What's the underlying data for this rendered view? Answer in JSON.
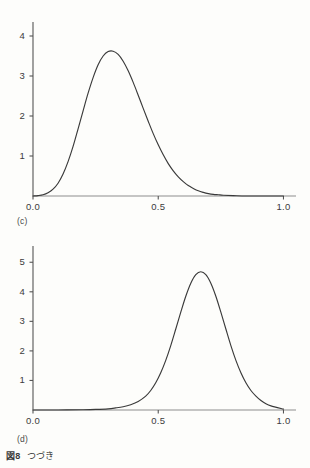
{
  "figure": {
    "caption_number": "図8",
    "caption_text": "つづき"
  },
  "panels": [
    {
      "id": "c",
      "label": "(c)"
    },
    {
      "id": "d",
      "label": "(d)"
    }
  ],
  "style": {
    "curve_color": "#3a3a3a",
    "axis_color": "#555555",
    "baseline_color": "#8e8e8e",
    "background": "#fdfdfb"
  },
  "chart_data": [
    {
      "type": "line",
      "panel": "(c)",
      "title": "",
      "xlabel": "",
      "ylabel": "",
      "xlim": [
        0.0,
        1.05
      ],
      "ylim": [
        0.0,
        4.35
      ],
      "grid": false,
      "legend": "none",
      "xticks": [
        0.0,
        0.5,
        1.0
      ],
      "xtick_labels": [
        "0.0",
        "0.5",
        "1.0"
      ],
      "yticks": [
        1,
        2,
        3,
        4
      ],
      "ytick_labels": [
        "1",
        "2",
        "3",
        "4"
      ],
      "peak": {
        "x": 0.32,
        "y": 3.62
      },
      "x": [
        0.0,
        0.02,
        0.04,
        0.06,
        0.08,
        0.1,
        0.12,
        0.14,
        0.16,
        0.18,
        0.2,
        0.22,
        0.24,
        0.26,
        0.28,
        0.3,
        0.32,
        0.34,
        0.36,
        0.38,
        0.4,
        0.42,
        0.44,
        0.46,
        0.48,
        0.5,
        0.52,
        0.54,
        0.56,
        0.58,
        0.6,
        0.62,
        0.64,
        0.66,
        0.68,
        0.7,
        0.72,
        0.74,
        0.76,
        0.8,
        0.85,
        0.9,
        0.95,
        1.0
      ],
      "y": [
        0.0,
        0.01,
        0.03,
        0.08,
        0.17,
        0.32,
        0.55,
        0.86,
        1.24,
        1.68,
        2.13,
        2.57,
        2.96,
        3.28,
        3.5,
        3.61,
        3.62,
        3.54,
        3.37,
        3.13,
        2.84,
        2.52,
        2.19,
        1.87,
        1.56,
        1.28,
        1.03,
        0.81,
        0.63,
        0.48,
        0.36,
        0.26,
        0.19,
        0.13,
        0.09,
        0.06,
        0.04,
        0.03,
        0.02,
        0.01,
        0.0,
        0.0,
        0.0,
        0.0
      ]
    },
    {
      "type": "line",
      "panel": "(d)",
      "title": "",
      "xlabel": "",
      "ylabel": "",
      "xlim": [
        0.0,
        1.05
      ],
      "ylim": [
        0.0,
        5.55
      ],
      "grid": false,
      "legend": "none",
      "xticks": [
        0.0,
        0.5,
        1.0
      ],
      "xtick_labels": [
        "0.0",
        "0.5",
        "1.0"
      ],
      "yticks": [
        1,
        2,
        3,
        4,
        5
      ],
      "ytick_labels": [
        "1",
        "2",
        "3",
        "4",
        "5"
      ],
      "peak": {
        "x": 0.67,
        "y": 4.68
      },
      "x": [
        0.0,
        0.1,
        0.2,
        0.25,
        0.3,
        0.33,
        0.36,
        0.39,
        0.42,
        0.45,
        0.47,
        0.49,
        0.51,
        0.53,
        0.55,
        0.57,
        0.59,
        0.61,
        0.63,
        0.65,
        0.67,
        0.69,
        0.71,
        0.73,
        0.75,
        0.77,
        0.79,
        0.81,
        0.83,
        0.85,
        0.87,
        0.89,
        0.91,
        0.93,
        0.95,
        1.0
      ],
      "y": [
        0.0,
        0.0,
        0.01,
        0.02,
        0.04,
        0.07,
        0.11,
        0.18,
        0.29,
        0.47,
        0.66,
        0.92,
        1.26,
        1.68,
        2.18,
        2.74,
        3.31,
        3.85,
        4.29,
        4.58,
        4.68,
        4.58,
        4.29,
        3.85,
        3.31,
        2.74,
        2.18,
        1.68,
        1.26,
        0.92,
        0.66,
        0.47,
        0.32,
        0.21,
        0.14,
        0.03
      ]
    }
  ]
}
